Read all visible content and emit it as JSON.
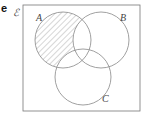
{
  "part_label": "e",
  "universal_set_symbol": "ℰ",
  "sets": [
    {
      "name": "A",
      "cx": 63,
      "cy": 40,
      "r": 28
    },
    {
      "name": "B",
      "cx": 101,
      "cy": 40,
      "r": 28
    },
    {
      "name": "C",
      "cx": 83,
      "cy": 77,
      "r": 28
    }
  ],
  "shaded_region": "A only (A ∩ B' ∩ C')",
  "colors": {
    "stroke": "#888888",
    "hatch": "#888888",
    "background": "#ffffff"
  }
}
